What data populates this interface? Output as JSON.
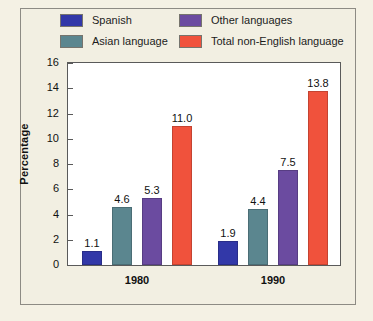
{
  "chart_data": {
    "type": "bar",
    "title": "",
    "xlabel": "",
    "ylabel": "Percentage",
    "ylim": [
      0,
      16
    ],
    "ytick_step": 2,
    "yticks": [
      16,
      14,
      12,
      10,
      8,
      6,
      4,
      2,
      0
    ],
    "grid": false,
    "legend_position": "top",
    "categories": [
      "1980",
      "1990"
    ],
    "series": [
      {
        "name": "Spanish",
        "color": "#3238a8",
        "values": [
          1.1,
          1.9
        ],
        "labels": [
          "1.1",
          "1.9"
        ]
      },
      {
        "name": "Asian language",
        "color": "#5b868f",
        "values": [
          4.6,
          4.4
        ],
        "labels": [
          "4.6",
          "4.4"
        ]
      },
      {
        "name": "Other languages",
        "color": "#6b4ba0",
        "values": [
          5.3,
          7.5
        ],
        "labels": [
          "5.3",
          "7.5"
        ]
      },
      {
        "name": "Total non-English language",
        "color": "#f0523c",
        "values": [
          11.0,
          13.8
        ],
        "labels": [
          "11.0",
          "13.8"
        ]
      }
    ]
  },
  "colors": {
    "page_background": "#f4f1e4",
    "plot_background": "#ffffff",
    "frame_border": "#8d8b84",
    "axis": "#5a5a5a",
    "text": "#111111"
  }
}
